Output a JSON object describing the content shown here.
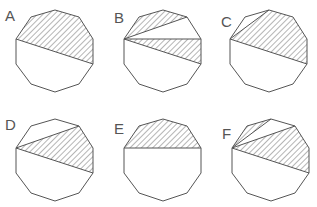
{
  "diagram": {
    "title": "",
    "shape": "regular decagon",
    "stroke_color": "#555555",
    "hatch_color": "#777777",
    "vertex_template": [
      [
        39,
        0
      ],
      [
        63,
        7
      ],
      [
        77,
        29
      ],
      [
        77,
        54
      ],
      [
        63,
        74
      ],
      [
        39,
        82
      ],
      [
        15,
        74
      ],
      [
        0,
        54
      ],
      [
        0,
        29
      ],
      [
        15,
        7
      ]
    ],
    "options": [
      {
        "label": "A",
        "origin": [
          16,
          10
        ],
        "label_pos": [
          5,
          8
        ],
        "chords": [
          [
            8,
            3
          ]
        ],
        "shaded": [
          [
            8,
            9,
            0,
            1,
            2,
            3
          ]
        ]
      },
      {
        "label": "B",
        "origin": [
          124,
          10
        ],
        "label_pos": [
          114,
          10
        ],
        "chords": [
          [
            8,
            1
          ],
          [
            8,
            2
          ],
          [
            8,
            3
          ]
        ],
        "shaded": [
          [
            8,
            9,
            0,
            1
          ],
          [
            8,
            2,
            3
          ]
        ]
      },
      {
        "label": "C",
        "origin": [
          230,
          10
        ],
        "label_pos": [
          221,
          14
        ],
        "chords": [
          [
            8,
            0
          ],
          [
            8,
            3
          ]
        ],
        "shaded": [
          [
            8,
            0,
            1,
            2,
            3
          ]
        ]
      },
      {
        "label": "D",
        "origin": [
          16,
          119
        ],
        "label_pos": [
          5,
          117
        ],
        "chords": [
          [
            8,
            1
          ],
          [
            8,
            3
          ]
        ],
        "shaded": [
          [
            8,
            1,
            2,
            3
          ]
        ]
      },
      {
        "label": "E",
        "origin": [
          124,
          119
        ],
        "label_pos": [
          114,
          121
        ],
        "chords": [
          [
            8,
            2
          ]
        ],
        "shaded": [
          [
            8,
            9,
            0,
            1,
            2
          ]
        ]
      },
      {
        "label": "F",
        "origin": [
          232,
          119
        ],
        "label_pos": [
          222,
          126
        ],
        "chords": [
          [
            8,
            0
          ],
          [
            8,
            1
          ],
          [
            8,
            3
          ]
        ],
        "shaded": [
          [
            8,
            9,
            0
          ],
          [
            8,
            1,
            2,
            3
          ]
        ]
      }
    ]
  }
}
